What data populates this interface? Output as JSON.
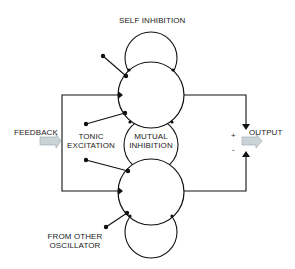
{
  "diagram": {
    "title_label": "SELF INHIBITION",
    "feedback_label": "FEEDBACK",
    "tonic_label_line1": "TONIC",
    "tonic_label_line2": "EXCITATION",
    "mutual_label_line1": "MUTUAL",
    "mutual_label_line2": "INHIBITION",
    "output_label": "OUTPUT",
    "plus_sign": "+",
    "minus_sign": "-",
    "oscillator_label_line1": "FROM OTHER",
    "oscillator_label_line2": "OSCILLATOR",
    "colors": {
      "line": "#111111",
      "arrow_fill": "#c9d3d8",
      "arrow_stroke": "#9aa6ac",
      "text": "#222222"
    }
  }
}
